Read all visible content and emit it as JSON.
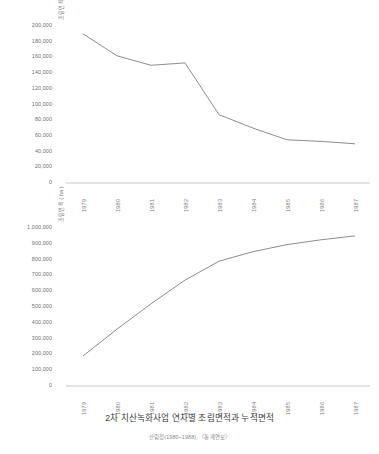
{
  "caption": {
    "title": "2차 치산녹화사업 연차별 조림면적과 누적면적",
    "source": "산림청(1980~1988), 〈통계연보〉"
  },
  "chart_data": [
    {
      "id": "annual",
      "type": "line",
      "title": "",
      "xlabel": "",
      "ylabel": "조림면적 ( ha )",
      "categories": [
        "1979",
        "1980",
        "1981",
        "1982",
        "1983",
        "1984",
        "1985",
        "1986",
        "1987"
      ],
      "values": [
        190000,
        162000,
        150000,
        153000,
        87000,
        70000,
        55000,
        53000,
        50000
      ],
      "ylim": [
        0,
        200000
      ],
      "yticks": [
        0,
        20000,
        40000,
        60000,
        80000,
        100000,
        120000,
        140000,
        160000,
        180000,
        200000
      ],
      "ytick_labels": [
        "0",
        "20,000",
        "40,000",
        "60,000",
        "80,000",
        "100,000",
        "120,000",
        "140,000",
        "160,000",
        "180,000",
        "200,000"
      ],
      "grid": false,
      "legend": "none",
      "line_color": "#8c8c8c"
    },
    {
      "id": "cumulative",
      "type": "line",
      "title": "",
      "xlabel": "",
      "ylabel": "조림면적 ( ha )",
      "categories": [
        "1979",
        "1980",
        "1981",
        "1982",
        "1983",
        "1984",
        "1985",
        "1986",
        "1987"
      ],
      "values": [
        190000,
        360000,
        520000,
        670000,
        790000,
        850000,
        895000,
        925000,
        950000
      ],
      "ylim": [
        0,
        1000000
      ],
      "yticks": [
        0,
        100000,
        200000,
        300000,
        400000,
        500000,
        600000,
        700000,
        800000,
        900000,
        1000000
      ],
      "ytick_labels": [
        "0",
        "100,000",
        "200,000",
        "300,000",
        "400,000",
        "500,000",
        "600,000",
        "700,000",
        "800,000",
        "900,000",
        "1,000,000"
      ],
      "grid": false,
      "legend": "none",
      "line_color": "#8c8c8c"
    }
  ],
  "colors": {
    "line": "#8c8c8c",
    "axis": "#c9c9c9",
    "tick_text": "#6f6f6f"
  }
}
